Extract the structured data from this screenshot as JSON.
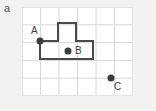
{
  "figure": {
    "panel_label": "a",
    "background_color": "#f2f2f0",
    "plot_background_color": "#ffffff",
    "grid_color": "#d8d8d8",
    "grid_border_color": "#e2e2e2",
    "shape_stroke_color": "#4a4a4c",
    "point_color": "#3b3b3d",
    "label_color": "#3b3b3d",
    "grid": {
      "columns": 6,
      "rows": 5,
      "cell_width": 18.5,
      "cell_height": 17.8,
      "origin_x": 22,
      "origin_y": 7,
      "width": 111,
      "height": 89
    },
    "shape": {
      "name": "t-shaped-polygon",
      "stroke_width": 2,
      "fill": "none",
      "vertices_px": [
        [
          18,
          34
        ],
        [
          18,
          52
        ],
        [
          71,
          52
        ],
        [
          71,
          34
        ],
        [
          54,
          34
        ],
        [
          54,
          16
        ],
        [
          36,
          16
        ],
        [
          36,
          34
        ]
      ]
    },
    "points": [
      {
        "id": "A",
        "label": "A",
        "x_px": 18,
        "y_px": 34,
        "radius": 3.5,
        "label_x_px": 9,
        "label_y_px": 19,
        "position_note": "on-boundary"
      },
      {
        "id": "B",
        "label": "B",
        "x_px": 46,
        "y_px": 44,
        "radius": 3.5,
        "label_x_px": 53,
        "label_y_px": 39,
        "position_note": "inside"
      },
      {
        "id": "C",
        "label": "C",
        "x_px": 89,
        "y_px": 71,
        "radius": 3.5,
        "label_x_px": 92,
        "label_y_px": 75,
        "position_note": "outside"
      }
    ]
  }
}
